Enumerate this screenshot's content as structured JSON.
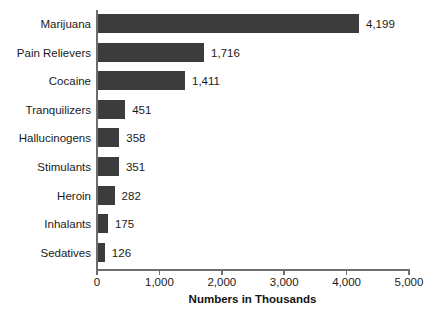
{
  "chart_data": {
    "type": "bar",
    "orientation": "horizontal",
    "title": "",
    "subtitle": "",
    "xlabel": "Numbers in Thousands",
    "ylabel": "",
    "categories": [
      "Marijuana",
      "Pain Relievers",
      "Cocaine",
      "Tranquilizers",
      "Hallucinogens",
      "Stimulants",
      "Heroin",
      "Inhalants",
      "Sedatives"
    ],
    "values": [
      4199,
      1716,
      1411,
      451,
      358,
      351,
      282,
      175,
      126
    ],
    "value_labels": [
      "4,199",
      "1,716",
      "1,411",
      "451",
      "358",
      "351",
      "282",
      "175",
      "126"
    ],
    "xlim": [
      0,
      5000
    ],
    "xticks": [
      0,
      1000,
      2000,
      3000,
      4000,
      5000
    ],
    "xtick_labels": [
      "0",
      "1,000",
      "2,000",
      "3,000",
      "4,000",
      "5,000"
    ],
    "grid": false,
    "legend": null,
    "bar_color": "#3c3c3c",
    "axis_color": "#6e6e6e",
    "text_color": "#1a1a1a",
    "background": "#ffffff"
  }
}
